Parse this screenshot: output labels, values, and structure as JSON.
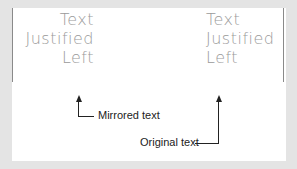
{
  "mirrored_text": {
    "lines": [
      "Text",
      "Justified",
      "Left"
    ]
  },
  "original_text": {
    "lines": [
      "Text",
      "Justified",
      "Left"
    ]
  },
  "callouts": {
    "mirrored_label": "Mirrored text",
    "original_label": "Original text"
  },
  "colors": {
    "background": "#e4e4e4",
    "panel": "#ffffff",
    "sample_text": "#9a9a9a",
    "callout_text": "#222222"
  }
}
